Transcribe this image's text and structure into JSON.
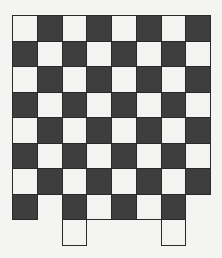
{
  "figure": {
    "origin": {
      "x": 12,
      "y": 15
    },
    "cell_width": 24.75,
    "cell_height": 25.5,
    "colors": {
      "light": "#f3f3f1",
      "dark": "#8a8a8a",
      "border": "#2a2a2a",
      "background": "#f4f4f2"
    },
    "rows": [
      [
        "L",
        "D",
        "L",
        "D",
        "L",
        "D",
        "L",
        "D"
      ],
      [
        "D",
        "L",
        "D",
        "L",
        "D",
        "L",
        "D",
        "L"
      ],
      [
        "L",
        "D",
        "L",
        "D",
        "L",
        "D",
        "L",
        "D"
      ],
      [
        "D",
        "L",
        "D",
        "L",
        "D",
        "L",
        "D",
        "L"
      ],
      [
        "L",
        "D",
        "L",
        "D",
        "L",
        "D",
        "L",
        "D"
      ],
      [
        "D",
        "L",
        "D",
        "L",
        "D",
        "L",
        "D",
        "L"
      ],
      [
        "L",
        "D",
        "L",
        "D",
        "L",
        "D",
        "L",
        "D"
      ],
      [
        "D",
        "",
        "D",
        "L",
        "D",
        "L",
        "D",
        ""
      ],
      [
        "",
        "",
        "L",
        "",
        "",
        "",
        "L",
        ""
      ]
    ]
  }
}
